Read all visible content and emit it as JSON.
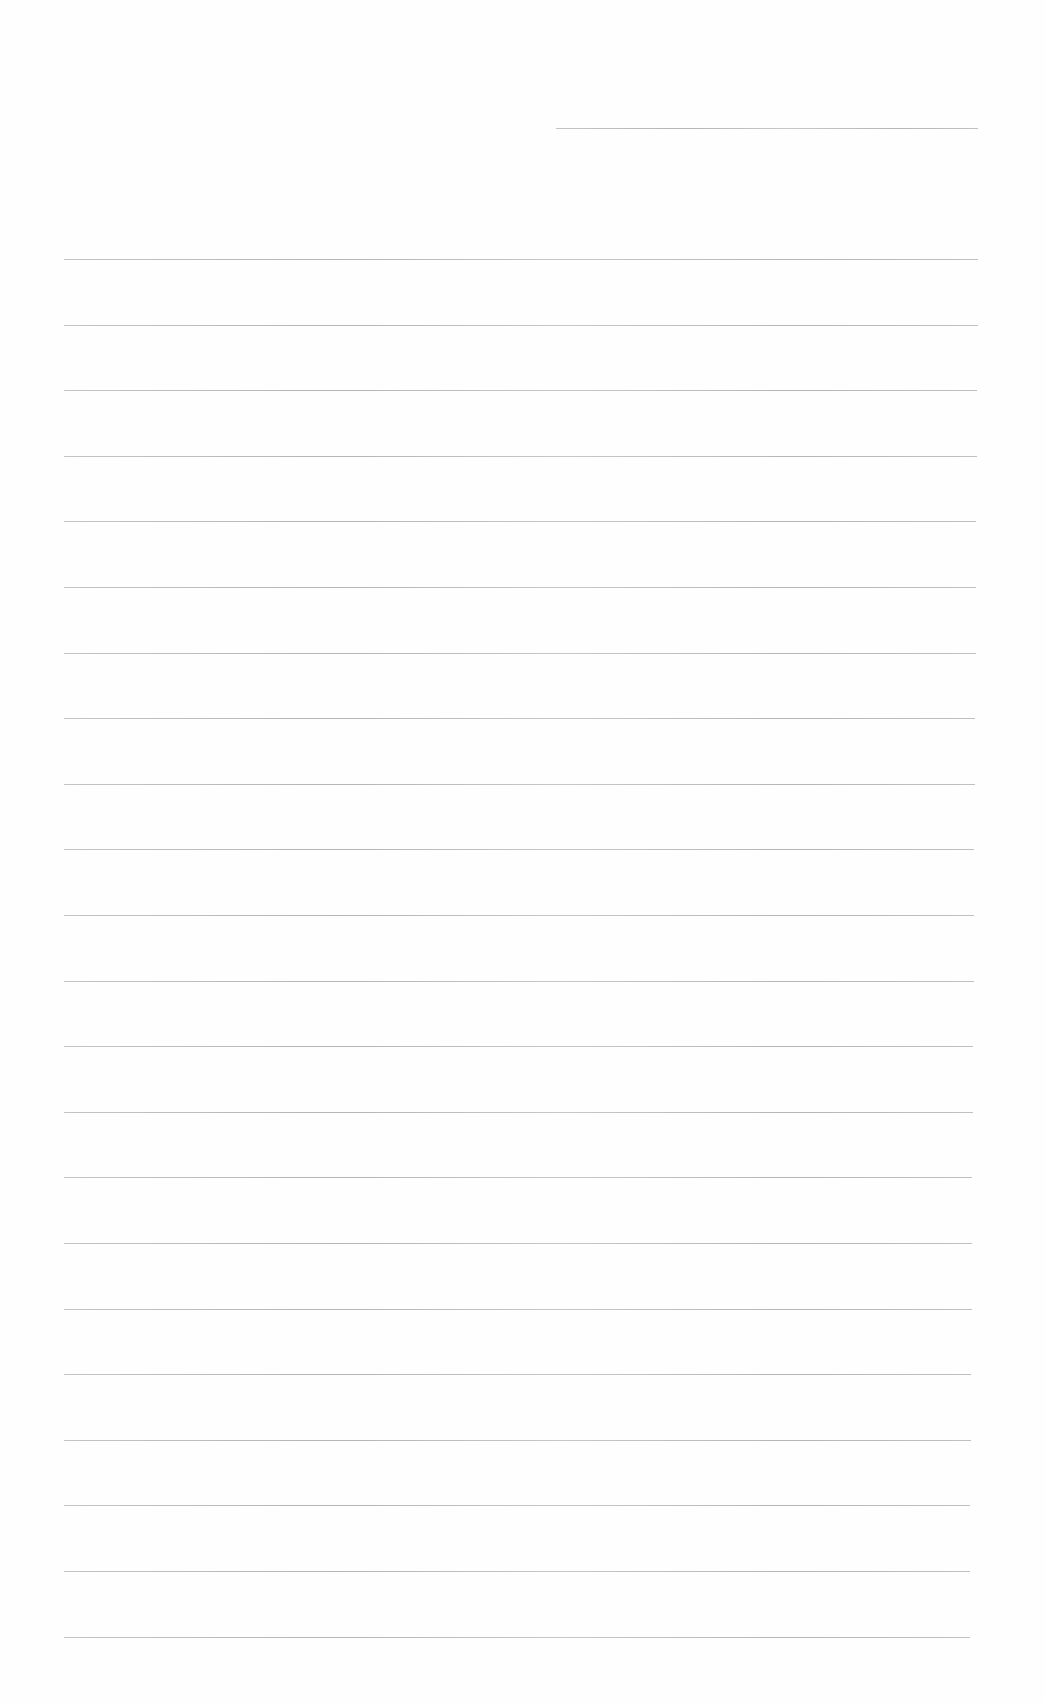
{
  "page": {
    "type": "blank ruled sheet",
    "background_color": "#fefefe",
    "line_color": "#b0b0b0",
    "header_line": {
      "left": 556,
      "right": 978,
      "y": 128
    },
    "ruled_lines": {
      "count": 22,
      "left": 64,
      "right": 978,
      "first_y": 259,
      "spacing": 65.6
    }
  }
}
